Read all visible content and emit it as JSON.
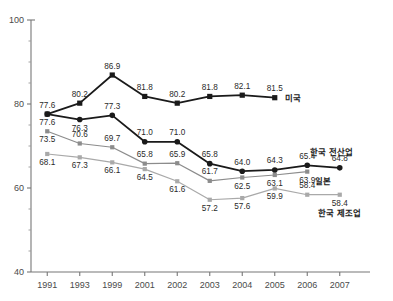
{
  "chart_data": {
    "type": "line",
    "title": "",
    "subtitle": "",
    "xlabel": "",
    "ylabel": "",
    "categories": [
      "1991",
      "1993",
      "1999",
      "2001",
      "2002",
      "2003",
      "2004",
      "2005",
      "2006",
      "2007"
    ],
    "ylim": [
      40,
      100
    ],
    "yticks": [
      40,
      60,
      80,
      100
    ],
    "ytick_labels": [
      "40",
      "60",
      "80",
      "100"
    ],
    "y_minor_step": 5,
    "grid": false,
    "legend_position": "inline-right",
    "series": [
      {
        "name": "미국",
        "label": "미국",
        "color": "#1a1a1a",
        "marker": "square",
        "line_width": 1.8,
        "x": [
          "1991",
          "1993",
          "1999",
          "2001",
          "2002",
          "2003",
          "2004",
          "2005"
        ],
        "values": [
          77.6,
          80.2,
          86.9,
          81.8,
          80.2,
          81.8,
          82.1,
          81.5
        ],
        "label_offsets": [
          "below",
          "above",
          "above",
          "above",
          "above",
          "above",
          "above",
          "above"
        ]
      },
      {
        "name": "한국 전산업",
        "label": "한국 전산업",
        "color": "#1a1a1a",
        "marker": "circle",
        "line_width": 1.8,
        "x": [
          "1991",
          "1993",
          "1999",
          "2001",
          "2002",
          "2003",
          "2004",
          "2005",
          "2006",
          "2007"
        ],
        "values": [
          77.6,
          76.3,
          77.3,
          71.0,
          71.0,
          65.8,
          64.0,
          64.3,
          65.4,
          64.8
        ],
        "label_offsets": [
          "above",
          "below",
          "above",
          "above",
          "above",
          "above",
          "above",
          "above",
          "above",
          "above"
        ]
      },
      {
        "name": "일본",
        "label": "일본",
        "color": "#8c8c8c",
        "marker": "square",
        "line_width": 1.2,
        "x": [
          "1991",
          "1993",
          "1999",
          "2001",
          "2002",
          "2003",
          "2004",
          "2005",
          "2006"
        ],
        "values": [
          73.5,
          70.6,
          69.7,
          65.8,
          65.9,
          61.7,
          62.5,
          63.1,
          63.9
        ],
        "label_offsets": [
          "below",
          "above",
          "above",
          "above",
          "above",
          "above",
          "below",
          "below",
          "below"
        ]
      },
      {
        "name": "한국 제조업",
        "label": "한국 제조업",
        "color": "#a9a9a9",
        "marker": "square",
        "line_width": 1.2,
        "x": [
          "1991",
          "1993",
          "1999",
          "2001",
          "2002",
          "2003",
          "2004",
          "2005",
          "2006",
          "2007"
        ],
        "values": [
          68.1,
          67.3,
          66.1,
          64.5,
          61.6,
          57.2,
          57.6,
          59.9,
          58.4,
          58.4
        ],
        "label_offsets": [
          "below",
          "below",
          "below",
          "below",
          "below",
          "below",
          "below",
          "below",
          "above",
          "below"
        ]
      }
    ],
    "series_end_labels": [
      {
        "series": "미국",
        "text": "미국",
        "at_x": "2005",
        "value": 81.5
      },
      {
        "series": "한국 전산업",
        "text": "한국 전산업",
        "at_x": "2007",
        "value": 64.8
      },
      {
        "series": "일본",
        "text": "일본",
        "at_x": "2006",
        "value": 63.9
      },
      {
        "series": "한국 제조업",
        "text": "한국 제조업",
        "at_x": "2007",
        "value": 58.4
      }
    ]
  },
  "axes": {
    "y_axis_label_top": "100",
    "y_axis_label_mid_high": "80",
    "y_axis_label_mid_low": "60",
    "y_axis_label_bottom": "40"
  }
}
